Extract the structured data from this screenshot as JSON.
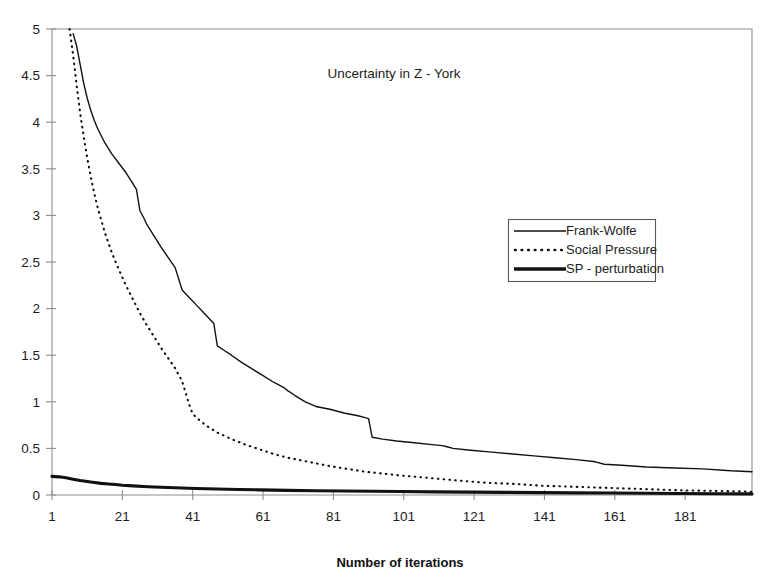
{
  "chart_data": {
    "type": "line",
    "title": "Uncertainty in Z - York",
    "xlabel": "Number of iterations",
    "ylabel": "",
    "xlim": [
      1,
      200
    ],
    "ylim": [
      0,
      5
    ],
    "grid": false,
    "legend_position": "center-right",
    "xticks": [
      1,
      21,
      41,
      61,
      81,
      101,
      121,
      141,
      161,
      181
    ],
    "xtick_labels": [
      "1",
      "21",
      "41",
      "61",
      "81",
      "101",
      "121",
      "141",
      "161",
      "181"
    ],
    "yticks": [
      0,
      0.5,
      1,
      1.5,
      2,
      2.5,
      3,
      3.5,
      4,
      4.5,
      5
    ],
    "ytick_labels": [
      "0",
      "0.5",
      "1",
      "1.5",
      "2",
      "2.5",
      "3",
      "3.5",
      "4",
      "4.5",
      "5"
    ],
    "series": [
      {
        "name": "Frank-Wolfe",
        "style": "solid-thin",
        "color": "#111111",
        "x": [
          7,
          8,
          9,
          10,
          11,
          12,
          13,
          14,
          16,
          18,
          20,
          22,
          24,
          25,
          26,
          27,
          28,
          30,
          32,
          34,
          36,
          38,
          40,
          42,
          44,
          46,
          47,
          48,
          50,
          52,
          55,
          58,
          61,
          64,
          66,
          67,
          68,
          70,
          73,
          76,
          80,
          84,
          88,
          90,
          91,
          92,
          95,
          99,
          104,
          109,
          112,
          113,
          115,
          120,
          126,
          132,
          138,
          144,
          150,
          155,
          156,
          158,
          163,
          170,
          178,
          186,
          194,
          200
        ],
        "y": [
          4.95,
          4.82,
          4.62,
          4.42,
          4.26,
          4.13,
          4.02,
          3.93,
          3.78,
          3.66,
          3.56,
          3.46,
          3.34,
          3.28,
          3.05,
          2.98,
          2.9,
          2.78,
          2.66,
          2.55,
          2.44,
          2.2,
          2.12,
          2.04,
          1.96,
          1.88,
          1.84,
          1.6,
          1.55,
          1.5,
          1.42,
          1.35,
          1.28,
          1.21,
          1.17,
          1.15,
          1.12,
          1.07,
          1.0,
          0.95,
          0.92,
          0.88,
          0.85,
          0.83,
          0.82,
          0.62,
          0.6,
          0.58,
          0.56,
          0.54,
          0.53,
          0.52,
          0.5,
          0.48,
          0.46,
          0.44,
          0.42,
          0.4,
          0.38,
          0.36,
          0.35,
          0.33,
          0.32,
          0.3,
          0.29,
          0.28,
          0.26,
          0.25
        ]
      },
      {
        "name": "Social Pressure",
        "style": "dotted",
        "color": "#111111",
        "x": [
          6,
          7,
          8,
          9,
          10,
          11,
          12,
          13,
          14,
          16,
          18,
          20,
          22,
          24,
          26,
          28,
          30,
          32,
          34,
          36,
          38,
          40,
          41,
          43,
          45,
          48,
          52,
          56,
          60,
          64,
          68,
          72,
          76,
          80,
          85,
          90,
          95,
          100,
          106,
          112,
          118,
          125,
          132,
          140,
          148,
          156,
          164,
          172,
          180,
          188,
          195,
          200
        ],
        "y": [
          5.0,
          4.72,
          4.4,
          4.1,
          3.85,
          3.62,
          3.42,
          3.24,
          3.08,
          2.82,
          2.6,
          2.42,
          2.25,
          2.1,
          1.95,
          1.82,
          1.7,
          1.58,
          1.47,
          1.36,
          1.22,
          0.97,
          0.87,
          0.8,
          0.74,
          0.67,
          0.6,
          0.54,
          0.49,
          0.44,
          0.4,
          0.37,
          0.34,
          0.31,
          0.28,
          0.25,
          0.23,
          0.21,
          0.19,
          0.17,
          0.15,
          0.13,
          0.12,
          0.1,
          0.09,
          0.08,
          0.07,
          0.06,
          0.05,
          0.045,
          0.04,
          0.035
        ]
      },
      {
        "name": "SP - perturbation",
        "style": "solid-thick",
        "color": "#111111",
        "x": [
          1,
          3,
          5,
          7,
          9,
          11,
          13,
          15,
          17,
          19,
          21,
          24,
          27,
          30,
          34,
          38,
          42,
          48,
          54,
          60,
          68,
          76,
          84,
          92,
          100,
          110,
          120,
          130,
          140,
          150,
          160,
          170,
          180,
          190,
          200
        ],
        "y": [
          0.2,
          0.195,
          0.185,
          0.17,
          0.155,
          0.145,
          0.135,
          0.125,
          0.118,
          0.112,
          0.105,
          0.098,
          0.092,
          0.086,
          0.08,
          0.075,
          0.07,
          0.064,
          0.059,
          0.055,
          0.05,
          0.046,
          0.043,
          0.04,
          0.037,
          0.034,
          0.031,
          0.028,
          0.025,
          0.023,
          0.021,
          0.019,
          0.016,
          0.014,
          0.012
        ]
      }
    ]
  },
  "legend": {
    "items": [
      {
        "label": "Frank-Wolfe",
        "style": "solid-thin"
      },
      {
        "label": "Social Pressure",
        "style": "dotted"
      },
      {
        "label": "SP - perturbation",
        "style": "solid-thick"
      }
    ]
  },
  "colors": {
    "ink": "#111111",
    "axis": "#8e8e8e",
    "background": "#ffffff"
  }
}
